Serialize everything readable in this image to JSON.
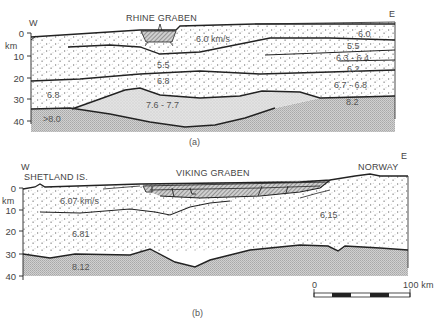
{
  "section_a": {
    "title": "RHINE GRABEN",
    "west_label": "W",
    "east_label": "E",
    "axis_unit": "km",
    "depth_ticks": [
      "0",
      "10",
      "20",
      "30",
      "40"
    ],
    "velocities": {
      "upper_crust_main": "6.0 km/s",
      "upper_crust_east": "6.0",
      "layer_5_5_center": "5.5",
      "layer_5_5_east": "5.5",
      "layer_6_3": "6.3 - 6.4",
      "layer_6_2": "6.2",
      "lower_crust_center": "6.8",
      "lower_crust_west": "6.8",
      "lower_crust_east": "6.7 - 6.8",
      "rift_cushion": "7.6 - 7.7",
      "mantle_west": ">8.0",
      "mantle_east": "8.2"
    },
    "caption": "(a)"
  },
  "section_b": {
    "title": "VIKING GRABEN",
    "west_label": "W",
    "west_place": "SHETLAND IS.",
    "east_label": "E",
    "east_place": "NORWAY",
    "axis_unit": "km",
    "depth_ticks": [
      "0",
      "10",
      "20",
      "30",
      "40"
    ],
    "velocities": {
      "upper_crust": "6.07 km/s",
      "lower_crust": "6.81",
      "east_crust": "6.15",
      "mantle": "8.12"
    },
    "caption": "(b)"
  },
  "scale_bar": {
    "start_label": "0",
    "end_label": "100 km"
  },
  "colors": {
    "line": "#222222",
    "crust_dots": "#555555",
    "cushion_fill": "#d9d9d9",
    "mantle_fill": "#c4c4c4",
    "sediment_fill": "#9a9a9a"
  }
}
